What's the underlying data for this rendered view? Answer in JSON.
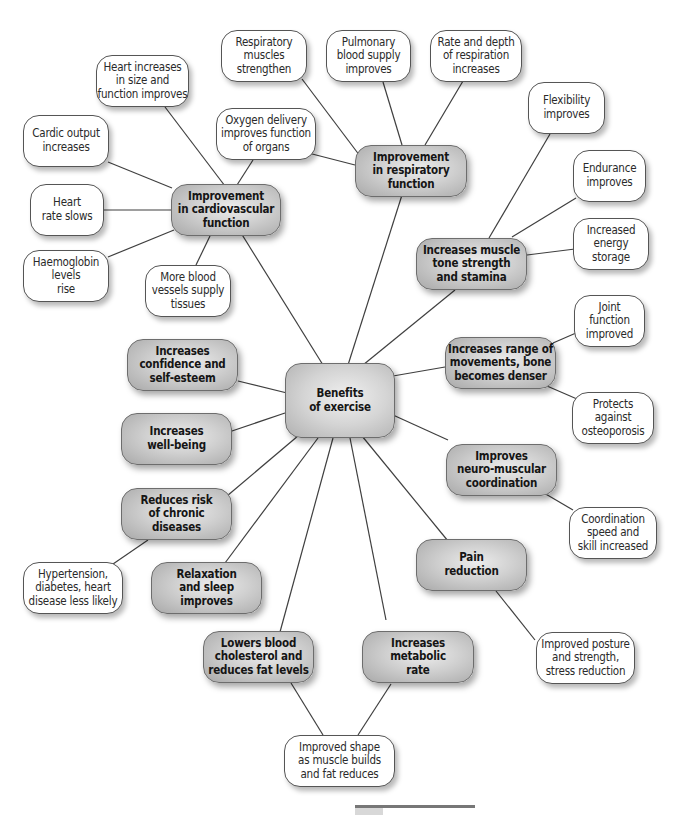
{
  "diagram": {
    "type": "mind-map",
    "center": {
      "id": "benefits",
      "label": "Benefits\nof exercise"
    },
    "hubs": [
      {
        "id": "cardio",
        "label": "Improvement\nin cardiovascular\nfunction"
      },
      {
        "id": "resp",
        "label": "Improvement\nin respiratory\nfunction"
      },
      {
        "id": "muscle",
        "label": "Increases muscle\ntone strength\nand stamina"
      },
      {
        "id": "range",
        "label": "Increases range of\nmovements, bone\nbecomes denser"
      },
      {
        "id": "neuro",
        "label": "Improves\nneuro-muscular\ncoordination"
      },
      {
        "id": "pain",
        "label": "Pain\nreduction"
      },
      {
        "id": "metabolic",
        "label": "Increases\nmetabolic\nrate"
      },
      {
        "id": "cholesterol",
        "label": "Lowers blood\ncholesterol and\nreduces fat levels"
      },
      {
        "id": "relax",
        "label": "Relaxation\nand sleep\nimproves"
      },
      {
        "id": "chronic",
        "label": "Reduces risk\nof chronic\ndiseases"
      },
      {
        "id": "wellbeing",
        "label": "Increases\nwell-being"
      },
      {
        "id": "confidence",
        "label": "Increases\nconfidence and\nself-esteem"
      }
    ],
    "leaves": [
      {
        "id": "heart_size",
        "label": "Heart increases\nin size and\nfunction improves",
        "parent": "cardio"
      },
      {
        "id": "cardiac_output",
        "label": "Cardic output\nincreases",
        "parent": "cardio"
      },
      {
        "id": "heart_rate",
        "label": "Heart\nrate slows",
        "parent": "cardio"
      },
      {
        "id": "haemoglobin",
        "label": "Haemoglobin\nlevels\nrise",
        "parent": "cardio"
      },
      {
        "id": "blood_vessels",
        "label": "More blood\nvessels supply\ntissues",
        "parent": "cardio"
      },
      {
        "id": "oxygen",
        "label": "Oxygen delivery\nimproves function\nof organs",
        "parent": "cardio, resp"
      },
      {
        "id": "resp_muscles",
        "label": "Respiratory\nmuscles\nstrengthen",
        "parent": "resp"
      },
      {
        "id": "pulmonary",
        "label": "Pulmonary\nblood supply\nimproves",
        "parent": "resp"
      },
      {
        "id": "rate_depth",
        "label": "Rate and depth\nof respiration\nincreases",
        "parent": "resp"
      },
      {
        "id": "flexibility",
        "label": "Flexibility\nimproves",
        "parent": "muscle"
      },
      {
        "id": "endurance",
        "label": "Endurance\nimproves",
        "parent": "muscle"
      },
      {
        "id": "energy",
        "label": "Increased\nenergy\nstorage",
        "parent": "muscle"
      },
      {
        "id": "joint",
        "label": "Joint\nfunction\nimproved",
        "parent": "range"
      },
      {
        "id": "osteo",
        "label": "Protects\nagainst\nosteoporosis",
        "parent": "range"
      },
      {
        "id": "coordination",
        "label": "Coordination\nspeed and\nskill increased",
        "parent": "neuro"
      },
      {
        "id": "posture",
        "label": "Improved posture\nand strength,\nstress reduction",
        "parent": "pain"
      },
      {
        "id": "shape",
        "label": "Improved shape\nas muscle builds\nand fat reduces",
        "parent": "cholesterol, metabolic"
      },
      {
        "id": "hypertension",
        "label": "Hypertension,\ndiabetes, heart\ndisease less likely",
        "parent": "chronic"
      }
    ]
  }
}
